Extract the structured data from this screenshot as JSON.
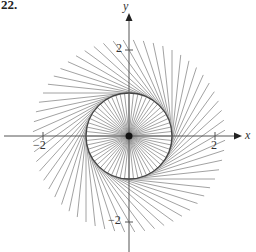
{
  "title": "22.",
  "axes": {
    "x_label": "x",
    "y_label": "y",
    "x_ticks": [
      {
        "value": -2,
        "label": "−2"
      },
      {
        "value": 2,
        "label": "2"
      }
    ],
    "y_ticks": [
      {
        "value": 2,
        "label": "2"
      },
      {
        "value": -2,
        "label": "−2"
      }
    ]
  },
  "figure": {
    "circle_radius": 1,
    "spoke_count": 60,
    "tangent_length": 2,
    "line_color": "#8a8a8a",
    "circle_color": "#444444",
    "axis_color": "#555555"
  }
}
